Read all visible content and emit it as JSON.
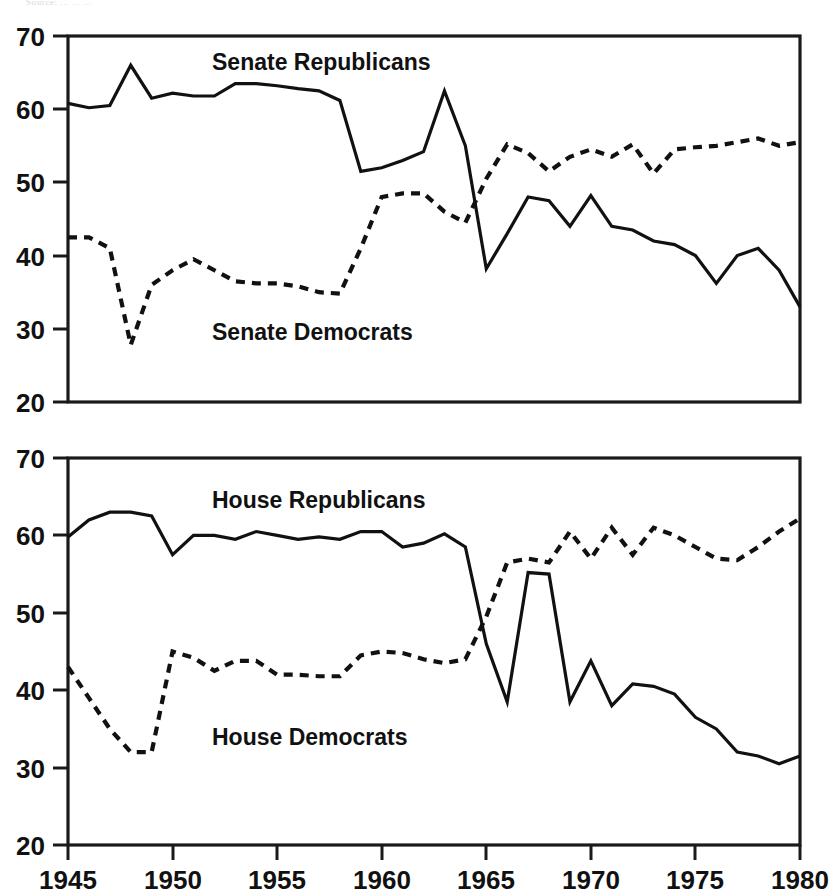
{
  "caption": {
    "text": "Source: ...  ...  ..."
  },
  "labels": {
    "senate_republicans": "Senate Republicans",
    "senate_democrats": "Senate Democrats",
    "house_republicans": "House Republicans",
    "house_democrats": "House Democrats"
  },
  "axis": {
    "y_ticks": [
      20,
      30,
      40,
      50,
      60,
      70
    ],
    "x_ticks": [
      1945,
      1950,
      1955,
      1960,
      1965,
      1970,
      1975,
      1980
    ]
  },
  "chart_data": [
    {
      "type": "line",
      "title": "Senate",
      "xlabel": "",
      "ylabel": "",
      "xlim": [
        1945,
        1980
      ],
      "ylim": [
        20,
        70
      ],
      "grid": false,
      "legend": "inline-annotation",
      "x": [
        1945,
        1946,
        1947,
        1948,
        1949,
        1950,
        1951,
        1952,
        1953,
        1954,
        1955,
        1956,
        1957,
        1958,
        1959,
        1960,
        1961,
        1962,
        1963,
        1964,
        1965,
        1966,
        1967,
        1968,
        1969,
        1970,
        1971,
        1972,
        1973,
        1974,
        1975,
        1976,
        1977,
        1978,
        1979,
        1980
      ],
      "series": [
        {
          "name": "Senate Republicans",
          "style": "solid",
          "annotation": "Senate Republicans",
          "values": [
            60.8,
            60.2,
            60.5,
            66.0,
            61.5,
            62.2,
            61.8,
            61.8,
            63.5,
            63.5,
            63.2,
            62.8,
            62.5,
            61.2,
            51.5,
            52.0,
            53.0,
            54.2,
            62.5,
            55.0,
            38.2,
            43.0,
            48.0,
            47.5,
            44.0,
            48.2,
            44.0,
            43.5,
            42.0,
            41.5,
            40.0,
            36.2,
            40.0,
            41.0,
            38.0,
            33.0
          ]
        },
        {
          "name": "Senate Democrats",
          "style": "dashed",
          "annotation": "Senate Democrats",
          "values": [
            42.5,
            42.5,
            41.0,
            27.8,
            36.0,
            38.0,
            39.5,
            38.0,
            36.5,
            36.2,
            36.2,
            35.8,
            35.0,
            34.8,
            41.0,
            48.0,
            48.5,
            48.5,
            46.0,
            44.5,
            50.5,
            55.2,
            54.0,
            51.5,
            53.5,
            54.5,
            53.5,
            55.2,
            51.2,
            54.5,
            54.8,
            55.0,
            55.5,
            56.0,
            55.0,
            55.5
          ]
        }
      ]
    },
    {
      "type": "line",
      "title": "House",
      "xlabel": "",
      "ylabel": "",
      "xlim": [
        1945,
        1980
      ],
      "ylim": [
        20,
        70
      ],
      "grid": false,
      "legend": "inline-annotation",
      "x": [
        1945,
        1946,
        1947,
        1948,
        1949,
        1950,
        1951,
        1952,
        1953,
        1954,
        1955,
        1956,
        1957,
        1958,
        1959,
        1960,
        1961,
        1962,
        1963,
        1964,
        1965,
        1966,
        1967,
        1968,
        1969,
        1970,
        1971,
        1972,
        1973,
        1974,
        1975,
        1976,
        1977,
        1978,
        1979,
        1980
      ],
      "series": [
        {
          "name": "House Republicans",
          "style": "solid",
          "annotation": "House Republicans",
          "values": [
            59.8,
            62.0,
            63.0,
            63.0,
            62.5,
            57.5,
            60.0,
            60.0,
            59.5,
            60.5,
            60.0,
            59.5,
            59.8,
            59.5,
            60.5,
            60.5,
            58.5,
            59.0,
            60.2,
            58.5,
            46.0,
            38.5,
            55.2,
            55.0,
            38.5,
            43.8,
            38.0,
            40.8,
            40.5,
            39.5,
            36.5,
            35.0,
            32.0,
            31.5,
            30.5,
            31.5
          ]
        },
        {
          "name": "House Democrats",
          "style": "dashed",
          "annotation": "House Democrats",
          "values": [
            43.0,
            39.0,
            35.0,
            32.0,
            32.0,
            45.0,
            44.2,
            42.5,
            43.8,
            43.8,
            42.0,
            42.0,
            41.8,
            41.8,
            44.5,
            45.0,
            44.8,
            44.0,
            43.5,
            44.0,
            49.5,
            56.5,
            57.0,
            56.5,
            60.5,
            57.0,
            61.0,
            57.5,
            61.0,
            60.0,
            58.5,
            57.0,
            56.8,
            58.5,
            60.5,
            62.2,
            60.5
          ]
        }
      ]
    }
  ]
}
